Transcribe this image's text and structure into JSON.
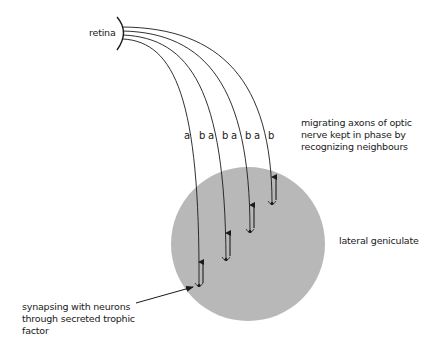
{
  "labels": {
    "retina": "retina",
    "migrating": "migrating axons of optic\nnerve kept in phase by\nrecognizing neighbours",
    "lateral_geniculate": "lateral geniculate",
    "synapsing": "synapsing with neurons\nthrough secreted trophic\nfactor"
  },
  "axon_pairs": [
    {
      "a": "a",
      "b": "b"
    },
    {
      "a": "a",
      "b": "b"
    },
    {
      "a": "a",
      "b": "b"
    },
    {
      "a": "a",
      "b": "b"
    }
  ],
  "colors": {
    "nucleus_fill": "#b8b8b8",
    "line": "#1a1a1a",
    "background": "#ffffff"
  }
}
